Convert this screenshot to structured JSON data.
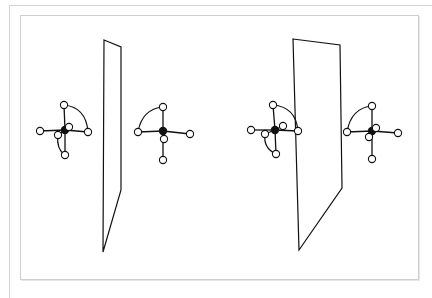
{
  "figure": {
    "colors": {
      "stroke": "#111111",
      "central_atom": "#111111",
      "substituent_atom": "#ffffff",
      "frame": "#d4d4d4"
    },
    "panels": [
      {
        "id": "left-pair",
        "mirror_plane": {
          "points": [
            [
              104,
              40
            ],
            [
              121,
              47
            ],
            [
              121,
              190
            ],
            [
              103,
              252
            ]
          ]
        },
        "molecules": [
          {
            "center": [
              65,
              130
            ],
            "atoms": [
              [
                64,
                105
              ],
              [
                40,
                131
              ],
              [
                88,
                132
              ],
              [
                69,
                127
              ],
              [
                58,
                135
              ],
              [
                65,
                155
              ]
            ]
          },
          {
            "center": [
              163,
              131
            ],
            "atoms": [
              [
                163,
                107
              ],
              [
                138,
                132
              ],
              [
                190,
                134
              ],
              [
                164,
                139
              ],
              [
                163,
                160
              ]
            ]
          }
        ]
      },
      {
        "id": "right-pair",
        "mirror_plane": {
          "points": [
            [
              293,
              39
            ],
            [
              340,
              45
            ],
            [
              342,
              188
            ],
            [
              299,
              250
            ]
          ]
        },
        "molecules": [
          {
            "center": [
              275,
              130
            ],
            "atoms": [
              [
                273,
                105
              ],
              [
                251,
                130
              ],
              [
                298,
                131
              ],
              [
                283,
                126
              ],
              [
                265,
                134
              ],
              [
                276,
                154
              ]
            ]
          },
          {
            "center": [
              372,
              131
            ],
            "atoms": [
              [
                372,
                106
              ],
              [
                347,
                132
              ],
              [
                398,
                133
              ],
              [
                376,
                128
              ],
              [
                369,
                137
              ],
              [
                372,
                159
              ]
            ]
          }
        ]
      }
    ]
  }
}
